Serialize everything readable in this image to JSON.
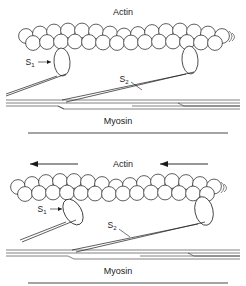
{
  "figure": {
    "background_color": "#ffffff",
    "ink_color": "#1a1a1a",
    "width": 246,
    "height": 286
  },
  "panels": [
    {
      "id": "top-panel",
      "state_description": "attached cross-bridges, no movement",
      "actin_label": "Actin",
      "myosin_label": "Myosin",
      "s1_label": "S",
      "s1_subscript": "1",
      "s2_label": "S",
      "s2_subscript": "2",
      "arrows": [],
      "heads": [
        {
          "name": "left-s1-head",
          "attached": true,
          "orientation": "vertical"
        },
        {
          "name": "right-s1-head",
          "attached": true,
          "orientation": "vertical"
        }
      ]
    },
    {
      "id": "bottom-panel",
      "state_description": "sliding filaments, left head tilted, right head detached",
      "actin_label": "Actin",
      "myosin_label": "Myosin",
      "s1_label": "S",
      "s1_subscript": "1",
      "s2_label": "S",
      "s2_subscript": "2",
      "arrows": [
        {
          "name": "motion-arrow-left",
          "direction": "left"
        },
        {
          "name": "motion-arrow-right",
          "direction": "left"
        }
      ],
      "heads": [
        {
          "name": "left-s1-head",
          "attached": true,
          "orientation": "tilted"
        },
        {
          "name": "right-s1-head",
          "attached": false,
          "orientation": "tilted"
        }
      ]
    }
  ],
  "actin_filament": {
    "description": "double helical strand of globular actin monomers drawn as overlapping circles",
    "monomer_count_per_row": 13,
    "rows": 2
  },
  "myosin_filament": {
    "description": "thick filament backbone drawn as paired horizontal lines with stepped offsets"
  }
}
